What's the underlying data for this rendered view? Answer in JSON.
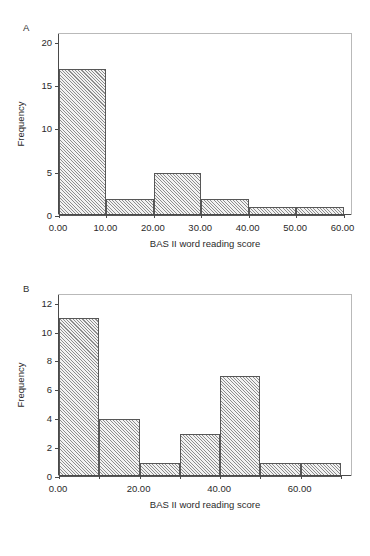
{
  "figure": {
    "background_color": "#ffffff",
    "bar_fill_color": "#dcdcdc",
    "bar_edge_color": "#575757",
    "axis_color": "#4a4a4a",
    "frame_color": "#b9b9b9"
  },
  "panels": [
    {
      "label": "A",
      "xlabel": "BAS II word reading score",
      "ylabel": "Frequency",
      "x_tick_labels": [
        "0.00",
        "10.00",
        "20.00",
        "30.00",
        "40.00",
        "50.00",
        "60.00"
      ],
      "y_tick_labels": [
        "0",
        "5",
        "10",
        "15",
        "20"
      ]
    },
    {
      "label": "B",
      "xlabel": "BAS II word reading score",
      "ylabel": "Frequency",
      "x_tick_labels": [
        "0.00",
        "20.00",
        "40.00",
        "60.00"
      ],
      "y_tick_labels": [
        "0",
        "2",
        "4",
        "6",
        "8",
        "10",
        "12"
      ]
    }
  ],
  "chart_data": [
    {
      "type": "bar",
      "panel": "A",
      "title": "",
      "xlabel": "BAS II word reading score",
      "ylabel": "Frequency",
      "categories": [
        "0-10",
        "10-20",
        "20-30",
        "30-40",
        "40-50",
        "50-60"
      ],
      "bin_edges": [
        0,
        10,
        20,
        30,
        40,
        50,
        60
      ],
      "values": [
        17,
        2,
        5,
        2,
        1,
        1
      ],
      "xlim": [
        0,
        62
      ],
      "ylim": [
        0,
        21
      ],
      "x_ticks": [
        0,
        10,
        20,
        30,
        40,
        50,
        60
      ],
      "x_tick_labels": [
        "0.00",
        "10.00",
        "20.00",
        "30.00",
        "40.00",
        "50.00",
        "60.00"
      ],
      "y_ticks": [
        0,
        5,
        10,
        15,
        20
      ],
      "y_tick_labels": [
        "0",
        "5",
        "10",
        "15",
        "20"
      ],
      "grid": false,
      "legend": false
    },
    {
      "type": "bar",
      "panel": "B",
      "title": "",
      "xlabel": "BAS II word reading score",
      "ylabel": "Frequency",
      "categories": [
        "0-10",
        "10-20",
        "20-30",
        "30-40",
        "40-50",
        "50-60",
        "60-70"
      ],
      "bin_edges": [
        0,
        10,
        20,
        30,
        40,
        50,
        60,
        70
      ],
      "values": [
        11,
        4,
        1,
        3,
        7,
        1,
        1
      ],
      "xlim": [
        0,
        73
      ],
      "ylim": [
        0,
        12.6
      ],
      "x_ticks": [
        0,
        10,
        20,
        30,
        40,
        50,
        60,
        70
      ],
      "x_tick_labels": [
        "0.00",
        "",
        "20.00",
        "",
        "40.00",
        "",
        "60.00",
        ""
      ],
      "y_ticks": [
        0,
        2,
        4,
        6,
        8,
        10,
        12
      ],
      "y_tick_labels": [
        "0",
        "2",
        "4",
        "6",
        "8",
        "10",
        "12"
      ],
      "grid": false,
      "legend": false
    }
  ]
}
